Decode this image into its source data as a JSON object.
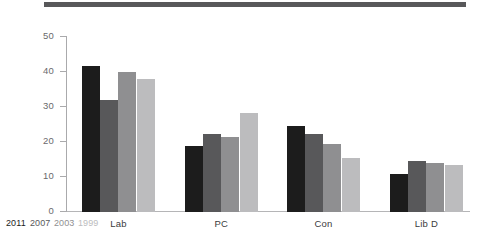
{
  "chart_data": {
    "type": "bar",
    "title": "",
    "subtitle": "",
    "xlabel": "",
    "ylabel": "% share of vote",
    "ylim": [
      0,
      50
    ],
    "ytick_step": 10,
    "yticks": [
      "0",
      "10",
      "20",
      "30",
      "40",
      "50"
    ],
    "grid": false,
    "legend_position": "bottom-left (axis corner, year labels tinted per series)",
    "categories": [
      "Lab",
      "PC",
      "Con",
      "Lib D"
    ],
    "series": [
      {
        "name": "2011",
        "color": "#1c1c1c",
        "values": [
          41.7,
          19.0,
          24.6,
          11.0
        ]
      },
      {
        "name": "2007",
        "color": "#58585a",
        "values": [
          32.0,
          22.3,
          22.2,
          14.7
        ]
      },
      {
        "name": "2003",
        "color": "#8f8f91",
        "values": [
          40.0,
          21.4,
          19.4,
          13.9
        ]
      },
      {
        "name": "1999",
        "color": "#bcbcbe",
        "values": [
          38.0,
          28.4,
          15.5,
          13.4
        ]
      }
    ]
  },
  "figure": {
    "top_rule_color": "#58585a",
    "axis_color": "#aaaaac",
    "tick_label_color": "#6a6a6c",
    "category_label_color": "#3b3b3d",
    "background": "#ffffff"
  }
}
